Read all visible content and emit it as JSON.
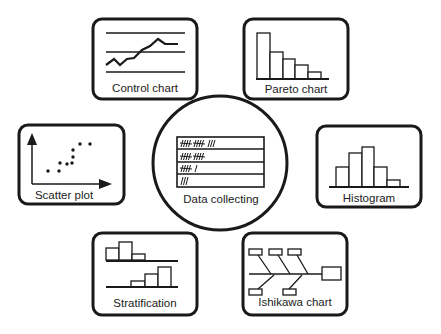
{
  "diagram": {
    "center": {
      "label": "Data collecting",
      "tally_rows": [
        "\\\\\\\\ \\\\\\\\ ///",
        "\\\\\\\\ \\\\\\\\",
        "\\\\\\\\ /",
        "///"
      ]
    },
    "tools": [
      {
        "id": "control-chart",
        "label": "Control chart"
      },
      {
        "id": "pareto-chart",
        "label": "Pareto chart"
      },
      {
        "id": "scatter-plot",
        "label": "Scatter plot"
      },
      {
        "id": "histogram",
        "label": "Histogram"
      },
      {
        "id": "stratification",
        "label": "Stratification"
      },
      {
        "id": "ishikawa-chart",
        "label": "Ishikawa chart"
      }
    ],
    "colors": {
      "stroke": "#1a1a1a",
      "background": "#ffffff"
    }
  }
}
